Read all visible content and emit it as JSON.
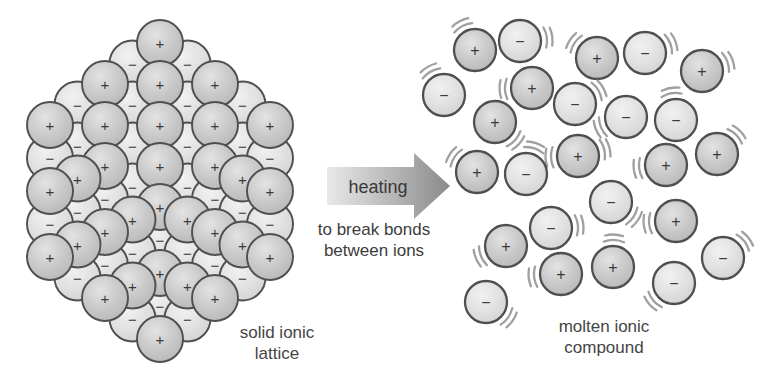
{
  "figure": {
    "labels": {
      "arrow_label": "heating",
      "arrow_sub_line1": "to break bonds",
      "arrow_sub_line2": "between ions",
      "lattice_caption_line1": "solid ionic",
      "lattice_caption_line2": "lattice",
      "molten_caption_line1": "molten ionic",
      "molten_caption_line2": "compound"
    },
    "colors": {
      "background": "#ffffff",
      "ion_outline": "#4f4f4f",
      "sign": "#3a3a3a",
      "vibration_marks": "#a0a0a0",
      "arrow_gradient_start": "#e9e9e9",
      "arrow_gradient_end": "#8a8a8a",
      "positive_ion_stops": [
        "#e3e3e3",
        "#c9c9c9",
        "#b7b7b7"
      ],
      "negative_ion_stops": [
        "#f1f1f1",
        "#e1e1e1",
        "#d2d2d2"
      ],
      "caption_text": "#454545"
    },
    "arrow": {
      "label": "heating",
      "sub_line1": "to break bonds",
      "sub_line2": "between ions",
      "geometry": {
        "x1": 327,
        "notch_x": 414,
        "tip_x": 450,
        "cy": 186,
        "half_height": 19,
        "head_half_height": 33
      }
    },
    "lattice": {
      "caption_line1": "solid ionic",
      "caption_line2": "lattice",
      "radius": 23,
      "sign_font_size": 15,
      "outline_width": 1.9,
      "ions": [
        {
          "x": 160,
          "y": 43,
          "s": "+"
        },
        {
          "x": 187.5,
          "y": 63.5,
          "s": "−"
        },
        {
          "x": 132.5,
          "y": 63.5,
          "s": "−"
        },
        {
          "x": 215,
          "y": 84,
          "s": "+"
        },
        {
          "x": 160,
          "y": 84,
          "s": "+"
        },
        {
          "x": 105,
          "y": 84,
          "s": "+"
        },
        {
          "x": 242.5,
          "y": 104.5,
          "s": "−"
        },
        {
          "x": 187.5,
          "y": 104.5,
          "s": "−"
        },
        {
          "x": 132.5,
          "y": 104.5,
          "s": "−"
        },
        {
          "x": 77.5,
          "y": 104.5,
          "s": "−"
        },
        {
          "x": 270,
          "y": 125,
          "s": "+"
        },
        {
          "x": 215,
          "y": 125,
          "s": "+"
        },
        {
          "x": 160,
          "y": 125,
          "s": "+"
        },
        {
          "x": 105,
          "y": 125,
          "s": "+"
        },
        {
          "x": 50,
          "y": 125,
          "s": "+"
        },
        {
          "x": 242.5,
          "y": 145.5,
          "s": "−"
        },
        {
          "x": 187.5,
          "y": 145.5,
          "s": "−"
        },
        {
          "x": 132.5,
          "y": 145.5,
          "s": "−"
        },
        {
          "x": 77.5,
          "y": 145.5,
          "s": "−"
        },
        {
          "x": 215,
          "y": 166,
          "s": "+"
        },
        {
          "x": 160,
          "y": 166,
          "s": "+"
        },
        {
          "x": 105,
          "y": 166,
          "s": "+"
        },
        {
          "x": 187.5,
          "y": 186.5,
          "s": "−"
        },
        {
          "x": 132.5,
          "y": 186.5,
          "s": "−"
        },
        {
          "x": 160,
          "y": 207,
          "s": "+"
        },
        {
          "x": 50,
          "y": 158,
          "s": "−"
        },
        {
          "x": 77.5,
          "y": 178.5,
          "s": "+"
        },
        {
          "x": 105,
          "y": 199,
          "s": "−"
        },
        {
          "x": 132.5,
          "y": 219.5,
          "s": "+"
        },
        {
          "x": 160,
          "y": 240,
          "s": "−"
        },
        {
          "x": 50,
          "y": 191,
          "s": "+"
        },
        {
          "x": 77.5,
          "y": 211.5,
          "s": "−"
        },
        {
          "x": 105,
          "y": 232,
          "s": "+"
        },
        {
          "x": 132.5,
          "y": 252.5,
          "s": "−"
        },
        {
          "x": 160,
          "y": 273,
          "s": "+"
        },
        {
          "x": 50,
          "y": 224,
          "s": "−"
        },
        {
          "x": 77.5,
          "y": 244.5,
          "s": "+"
        },
        {
          "x": 105,
          "y": 265,
          "s": "−"
        },
        {
          "x": 132.5,
          "y": 285.5,
          "s": "+"
        },
        {
          "x": 160,
          "y": 306,
          "s": "−"
        },
        {
          "x": 50,
          "y": 257,
          "s": "+"
        },
        {
          "x": 77.5,
          "y": 277.5,
          "s": "−"
        },
        {
          "x": 105,
          "y": 298,
          "s": "+"
        },
        {
          "x": 132.5,
          "y": 318.5,
          "s": "−"
        },
        {
          "x": 160,
          "y": 339,
          "s": "+"
        },
        {
          "x": 270,
          "y": 158,
          "s": "−"
        },
        {
          "x": 242.5,
          "y": 178.5,
          "s": "+"
        },
        {
          "x": 215,
          "y": 199,
          "s": "−"
        },
        {
          "x": 187.5,
          "y": 219.5,
          "s": "+"
        },
        {
          "x": 270,
          "y": 191,
          "s": "+"
        },
        {
          "x": 242.5,
          "y": 211.5,
          "s": "−"
        },
        {
          "x": 215,
          "y": 232,
          "s": "+"
        },
        {
          "x": 187.5,
          "y": 252.5,
          "s": "−"
        },
        {
          "x": 270,
          "y": 224,
          "s": "−"
        },
        {
          "x": 242.5,
          "y": 244.5,
          "s": "+"
        },
        {
          "x": 215,
          "y": 265,
          "s": "−"
        },
        {
          "x": 187.5,
          "y": 285.5,
          "s": "+"
        },
        {
          "x": 270,
          "y": 257,
          "s": "+"
        },
        {
          "x": 242.5,
          "y": 277.5,
          "s": "−"
        },
        {
          "x": 215,
          "y": 298,
          "s": "+"
        },
        {
          "x": 187.5,
          "y": 318.5,
          "s": "−"
        }
      ]
    },
    "molten": {
      "caption_line1": "molten ionic",
      "caption_line2": "compound",
      "radius": 21,
      "sign_font_size": 16,
      "outline_width": 2.3,
      "ions": [
        {
          "x": 475,
          "y": 50,
          "s": "+",
          "v": [
            118
          ]
        },
        {
          "x": 520,
          "y": 41,
          "s": "−",
          "v": [
            8
          ]
        },
        {
          "x": 597,
          "y": 58,
          "s": "+",
          "v": [
            146
          ]
        },
        {
          "x": 645,
          "y": 53,
          "s": "−",
          "v": [
            21
          ]
        },
        {
          "x": 702,
          "y": 71,
          "s": "+",
          "v": [
            20
          ]
        },
        {
          "x": 444,
          "y": 95,
          "s": "−",
          "v": [
            120
          ]
        },
        {
          "x": 532,
          "y": 88,
          "s": "+",
          "v": [
            182
          ]
        },
        {
          "x": 575,
          "y": 104,
          "s": "−",
          "v": [
            30
          ]
        },
        {
          "x": 626,
          "y": 117,
          "s": "−",
          "v": [
            203
          ]
        },
        {
          "x": 676,
          "y": 120,
          "s": "−",
          "v": [
            100
          ]
        },
        {
          "x": 495,
          "y": 122,
          "s": "+",
          "v": [
            318
          ]
        },
        {
          "x": 578,
          "y": 156,
          "s": "+",
          "v": [
            183,
            15
          ]
        },
        {
          "x": 717,
          "y": 154,
          "s": "+",
          "v": [
            45
          ]
        },
        {
          "x": 666,
          "y": 165,
          "s": "+",
          "v": [
            187
          ]
        },
        {
          "x": 477,
          "y": 172,
          "s": "+",
          "v": [
            146
          ]
        },
        {
          "x": 526,
          "y": 174,
          "s": "−",
          "v": [
            72
          ]
        },
        {
          "x": 611,
          "y": 202,
          "s": "−",
          "v": [
            326
          ]
        },
        {
          "x": 676,
          "y": 221,
          "s": "+",
          "v": [
            185
          ]
        },
        {
          "x": 551,
          "y": 228,
          "s": "−",
          "v": [
            6
          ]
        },
        {
          "x": 506,
          "y": 246,
          "s": "+",
          "v": [
            203
          ]
        },
        {
          "x": 723,
          "y": 258,
          "s": "−",
          "v": [
            38
          ]
        },
        {
          "x": 561,
          "y": 274,
          "s": "+",
          "v": [
            186
          ]
        },
        {
          "x": 613,
          "y": 267,
          "s": "+",
          "v": [
            88
          ]
        },
        {
          "x": 674,
          "y": 283,
          "s": "−",
          "v": [
            221
          ]
        },
        {
          "x": 486,
          "y": 302,
          "s": "−",
          "v": [
            325
          ]
        }
      ]
    }
  }
}
